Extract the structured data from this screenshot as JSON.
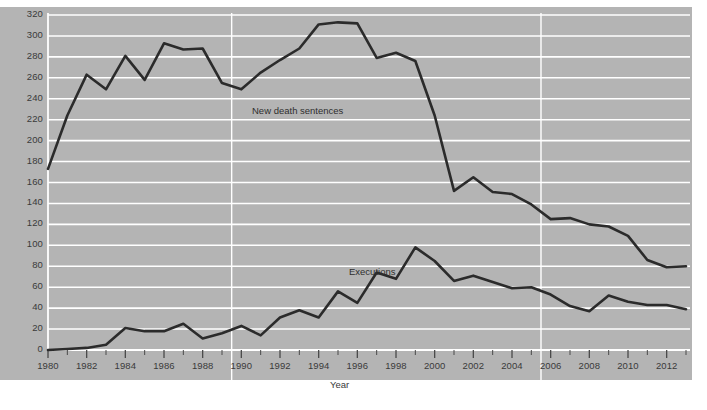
{
  "chart_data": {
    "type": "line",
    "title": "",
    "subtitle": "",
    "xlabel": "Year",
    "ylabel": "",
    "xlim": [
      1980,
      2013
    ],
    "ylim": [
      0,
      320
    ],
    "grid": "horizontal-major-plus-two-verticals",
    "legend_position": "inline-annotation",
    "y_ticks": [
      0,
      20,
      40,
      60,
      80,
      100,
      120,
      140,
      160,
      180,
      200,
      220,
      240,
      260,
      280,
      300,
      320
    ],
    "x_ticks_labeled": [
      1980,
      1982,
      1984,
      1986,
      1988,
      1990,
      1992,
      1994,
      1996,
      1998,
      2000,
      2002,
      2004,
      2006,
      2008,
      2010,
      2012
    ],
    "x_ticks_all": [
      1980,
      1981,
      1982,
      1983,
      1984,
      1985,
      1986,
      1987,
      1988,
      1989,
      1990,
      1991,
      1992,
      1993,
      1994,
      1995,
      1996,
      1997,
      1998,
      1999,
      2000,
      2001,
      2002,
      2003,
      2004,
      2005,
      2006,
      2007,
      2008,
      2009,
      2010,
      2011,
      2012,
      2013
    ],
    "vertical_gridline_years": [
      1989.5,
      2005.5
    ],
    "x": [
      1980,
      1981,
      1982,
      1983,
      1984,
      1985,
      1986,
      1987,
      1988,
      1989,
      1990,
      1991,
      1992,
      1993,
      1994,
      1995,
      1996,
      1997,
      1998,
      1999,
      2000,
      2001,
      2002,
      2003,
      2004,
      2005,
      2006,
      2007,
      2008,
      2009,
      2010,
      2011,
      2012,
      2013
    ],
    "series": [
      {
        "name": "New death sentences",
        "color": "#2b2b2b",
        "values": [
          173,
          224,
          263,
          249,
          281,
          258,
          293,
          287,
          288,
          255,
          249,
          265,
          277,
          288,
          311,
          313,
          312,
          279,
          284,
          276,
          224,
          152,
          165,
          151,
          149,
          139,
          125,
          126,
          120,
          118,
          109,
          86,
          79,
          80
        ]
      },
      {
        "name": "Executions",
        "color": "#2b2b2b",
        "values": [
          0,
          1,
          2,
          5,
          21,
          18,
          18,
          25,
          11,
          16,
          23,
          14,
          31,
          38,
          31,
          56,
          45,
          74,
          68,
          98,
          85,
          66,
          71,
          65,
          59,
          60,
          53,
          42,
          37,
          52,
          46,
          43,
          43,
          39
        ]
      }
    ],
    "annotations": [
      {
        "text": "New death sentences",
        "series": "New death sentences"
      },
      {
        "text": "Executions",
        "series": "Executions"
      }
    ]
  },
  "style": {
    "panel_background": "#b4b4b4",
    "page_background": "#ffffff",
    "gridline_color": "#ffffff",
    "axis_color": "#ffffff",
    "line_color": "#2b2b2b",
    "tick_text_color": "#3a3a3a"
  }
}
